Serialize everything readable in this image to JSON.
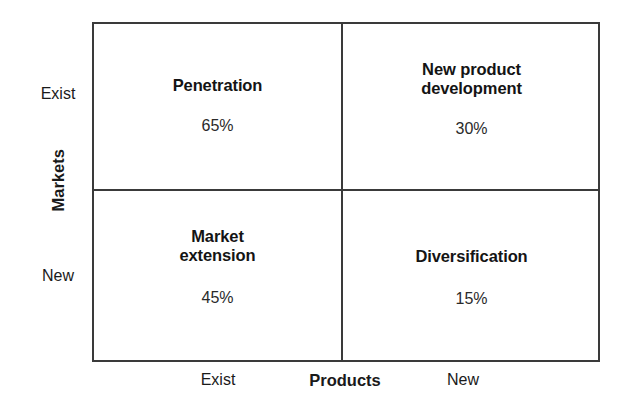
{
  "diagram": {
    "type": "ansoff-matrix",
    "axes": {
      "y": {
        "title": "Markets",
        "ticks": [
          "Exist",
          "New"
        ]
      },
      "x": {
        "title": "Products",
        "ticks": [
          "Exist",
          "New"
        ]
      }
    },
    "quadrants": [
      {
        "position": "top-left",
        "title": "Penetration",
        "value": "65%"
      },
      {
        "position": "top-right",
        "title": "New product\ndevelopment",
        "value": "30%"
      },
      {
        "position": "bottom-left",
        "title": "Market\nextension",
        "value": "45%"
      },
      {
        "position": "bottom-right",
        "title": "Diversification",
        "value": "15%"
      }
    ]
  },
  "chart_data": {
    "type": "table",
    "title": "",
    "xlabel": "Products",
    "ylabel": "Markets",
    "x_categories": [
      "Exist",
      "New"
    ],
    "y_categories": [
      "Exist",
      "New"
    ],
    "cells": [
      {
        "row": "Exist",
        "col": "Exist",
        "label": "Penetration",
        "value": 65,
        "value_text": "65%"
      },
      {
        "row": "Exist",
        "col": "New",
        "label": "New product development",
        "value": 30,
        "value_text": "30%"
      },
      {
        "row": "New",
        "col": "Exist",
        "label": "Market extension",
        "value": 45,
        "value_text": "45%"
      },
      {
        "row": "New",
        "col": "New",
        "label": "Diversification",
        "value": 15,
        "value_text": "15%"
      }
    ],
    "grid": true,
    "legend": "none"
  },
  "colors": {
    "line": "#3a3a3a",
    "text": "#1a1a1a",
    "background": "#ffffff"
  }
}
